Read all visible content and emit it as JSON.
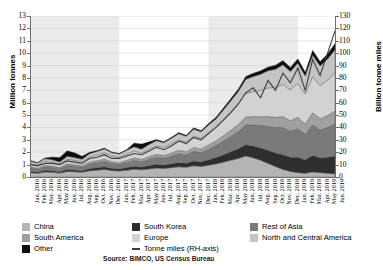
{
  "chart_data": {
    "type": "area",
    "title": "2016-2019",
    "xlabel": "",
    "ylabel": "Million tonnes",
    "ylabel_right": "Billion tonne miles",
    "ylim": [
      0,
      13
    ],
    "ylim_right": [
      0,
      130
    ],
    "yticks": [
      0,
      1,
      2,
      3,
      4,
      5,
      6,
      7,
      8,
      9,
      10,
      11,
      12,
      13
    ],
    "yticks_right": [
      0,
      10,
      20,
      30,
      40,
      50,
      60,
      70,
      80,
      90,
      100,
      110,
      120,
      130
    ],
    "grid": true,
    "legend_position": "bottom",
    "source": "Source: BIMCO, US Census Bureau",
    "stacked": true,
    "categories": [
      "Jan. 2016",
      "Feb. 2016",
      "Mar. 2016",
      "Apr. 2016",
      "May 2016",
      "Jun. 2016",
      "Jul. 2016",
      "Aug. 2016",
      "Sep. 2016",
      "Oct. 2016",
      "Nov. 2016",
      "Dec. 2016",
      "Jan. 2017",
      "Feb. 2017",
      "Mar. 2017",
      "Apr. 2017",
      "May 2017",
      "Jun. 2017",
      "Jul. 2017",
      "Aug. 2017",
      "Sep. 2017",
      "Oct. 2017",
      "Nov. 2017",
      "Dec. 2017",
      "Jan. 2018",
      "Feb. 2018",
      "Mar. 2018",
      "Apr. 2018",
      "May 2018",
      "Jun. 2018",
      "Jul. 2018",
      "Aug. 2018",
      "Sep. 2018",
      "Oct. 2018",
      "Nov. 2018",
      "Dec. 2018",
      "Jan. 2019",
      "Feb. 2019",
      "Mar. 2019",
      "Apr. 2019",
      "May 2019",
      "Jun. 2019"
    ],
    "series": [
      {
        "name": "China",
        "color": "#b4b4b4",
        "values": [
          0.35,
          0.3,
          0.4,
          0.38,
          0.32,
          0.45,
          0.42,
          0.38,
          0.5,
          0.55,
          0.6,
          0.52,
          0.48,
          0.55,
          0.62,
          0.58,
          0.65,
          0.72,
          0.68,
          0.75,
          0.82,
          0.78,
          0.9,
          0.85,
          0.95,
          1.05,
          1.2,
          1.35,
          1.5,
          1.7,
          1.55,
          1.35,
          1.1,
          0.85,
          0.6,
          0.45,
          0.35,
          0.3,
          0.4,
          0.35,
          0.3,
          0.25
        ]
      },
      {
        "name": "South Korea",
        "color": "#2e2e2e",
        "values": [
          0.12,
          0.1,
          0.14,
          0.13,
          0.11,
          0.16,
          0.15,
          0.13,
          0.18,
          0.2,
          0.22,
          0.19,
          0.18,
          0.21,
          0.24,
          0.22,
          0.26,
          0.3,
          0.28,
          0.32,
          0.36,
          0.34,
          0.4,
          0.38,
          0.45,
          0.52,
          0.6,
          0.68,
          0.78,
          0.9,
          0.95,
          1.0,
          1.05,
          1.1,
          1.2,
          1.15,
          1.25,
          1.1,
          1.35,
          1.2,
          1.3,
          1.45
        ]
      },
      {
        "name": "Rest of Asia",
        "color": "#7a7a7a",
        "values": [
          0.25,
          0.22,
          0.28,
          0.26,
          0.24,
          0.32,
          0.3,
          0.28,
          0.36,
          0.4,
          0.44,
          0.38,
          0.36,
          0.42,
          0.48,
          0.44,
          0.52,
          0.58,
          0.55,
          0.62,
          0.7,
          0.66,
          0.78,
          0.74,
          0.85,
          0.95,
          1.1,
          1.25,
          1.4,
          1.6,
          1.7,
          1.8,
          1.95,
          2.05,
          2.2,
          2.1,
          2.3,
          2.05,
          2.45,
          2.25,
          2.4,
          2.6
        ]
      },
      {
        "name": "South America",
        "color": "#a0a0a0",
        "values": [
          0.1,
          0.09,
          0.12,
          0.11,
          0.1,
          0.13,
          0.12,
          0.11,
          0.15,
          0.16,
          0.18,
          0.15,
          0.14,
          0.17,
          0.19,
          0.18,
          0.21,
          0.23,
          0.22,
          0.25,
          0.28,
          0.26,
          0.31,
          0.29,
          0.34,
          0.38,
          0.44,
          0.5,
          0.56,
          0.64,
          0.68,
          0.72,
          0.78,
          0.82,
          0.88,
          0.84,
          0.92,
          0.82,
          0.98,
          0.9,
          0.96,
          1.04
        ]
      },
      {
        "name": "Europe",
        "color": "#d2d2d2",
        "values": [
          0.3,
          0.26,
          0.34,
          0.32,
          0.28,
          0.38,
          0.36,
          0.33,
          0.43,
          0.47,
          0.52,
          0.45,
          0.43,
          0.5,
          0.57,
          0.52,
          0.62,
          0.69,
          0.65,
          0.74,
          0.83,
          0.78,
          0.92,
          0.87,
          1.0,
          1.12,
          1.3,
          1.48,
          1.66,
          1.9,
          2.02,
          2.14,
          2.31,
          2.43,
          2.61,
          2.49,
          2.73,
          2.43,
          2.91,
          2.67,
          2.85,
          3.09
        ]
      },
      {
        "name": "North and Central America",
        "color": "#c4c4c4",
        "values": [
          0.18,
          0.16,
          0.2,
          0.19,
          0.17,
          0.23,
          0.22,
          0.2,
          0.26,
          0.28,
          0.31,
          0.27,
          0.26,
          0.3,
          0.34,
          0.31,
          0.37,
          0.41,
          0.39,
          0.44,
          0.5,
          0.47,
          0.55,
          0.52,
          0.6,
          0.67,
          0.78,
          0.89,
          1.0,
          1.14,
          1.21,
          1.28,
          1.39,
          1.46,
          1.57,
          1.49,
          1.64,
          1.46,
          1.75,
          1.6,
          1.71,
          1.85
        ]
      },
      {
        "name": "Other",
        "color": "#0d0d0d",
        "values": [
          0.05,
          0.04,
          0.06,
          0.22,
          0.35,
          0.45,
          0.38,
          0.25,
          0.12,
          0.08,
          0.07,
          0.06,
          0.06,
          0.07,
          0.3,
          0.42,
          0.22,
          0.1,
          0.08,
          0.09,
          0.1,
          0.09,
          0.11,
          0.1,
          0.12,
          0.14,
          0.16,
          0.18,
          0.2,
          0.24,
          0.26,
          0.28,
          0.3,
          0.32,
          0.35,
          0.33,
          0.36,
          0.32,
          0.4,
          0.36,
          0.42,
          0.5
        ]
      }
    ],
    "line_series": {
      "name": "Tonne miles (RH-axis)",
      "color": "#3b3b3b",
      "axis": "right",
      "values": [
        10,
        9,
        11,
        11,
        10,
        13,
        12,
        11,
        15,
        16,
        18,
        15,
        15,
        17,
        19,
        18,
        21,
        24,
        22,
        25,
        29,
        27,
        32,
        30,
        35,
        40,
        46,
        52,
        59,
        68,
        72,
        64,
        78,
        70,
        84,
        76,
        88,
        70,
        95,
        82,
        100,
        118
      ]
    },
    "year_bands": [
      {
        "label": "2016",
        "shaded": true
      },
      {
        "label": "2017",
        "shaded": false
      },
      {
        "label": "2018",
        "shaded": true
      },
      {
        "label": "2019",
        "shaded": false
      }
    ]
  },
  "legend": {
    "col0": [
      {
        "label": "China",
        "color": "#b4b4b4",
        "type": "swatch"
      },
      {
        "label": "South America",
        "color": "#a0a0a0",
        "type": "swatch"
      },
      {
        "label": "Other",
        "color": "#0d0d0d",
        "type": "swatch"
      }
    ],
    "col1": [
      {
        "label": "South Korea",
        "color": "#2e2e2e",
        "type": "swatch"
      },
      {
        "label": "Europe",
        "color": "#d2d2d2",
        "type": "swatch"
      },
      {
        "label": "Tonne miles (RH-axis)",
        "color": "#3b3b3b",
        "type": "line"
      }
    ],
    "col2": [
      {
        "label": "Rest of Asia",
        "color": "#7a7a7a",
        "type": "swatch"
      },
      {
        "label": "North and Central America",
        "color": "#c4c4c4",
        "type": "swatch"
      }
    ]
  }
}
